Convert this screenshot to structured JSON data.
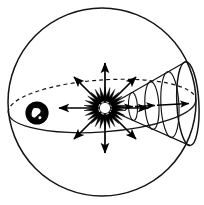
{
  "figure": {
    "title": "Solar radiation cone within celestial sphere",
    "type": "astronomy-schematic",
    "width": 204,
    "height": 205,
    "background_color": "#ffffff",
    "ink_color": "#000000"
  },
  "celestial_sphere": {
    "label": "celestial-sphere",
    "center_x": 102,
    "center_y": 102,
    "radius": 94,
    "stroke_width": 1.4,
    "fill": "#ffffff",
    "stroke": "#111111"
  },
  "orbit": {
    "label": "orbit-ellipse",
    "center_x": 102,
    "center_y": 106,
    "rx": 94,
    "ry": 26,
    "rotation_deg": -4,
    "near_half_style": "solid",
    "far_half_style": "dashed",
    "dash_pattern": "4 3",
    "stroke_width": 1.2,
    "stroke": "#111111"
  },
  "sun": {
    "label": "sun-star-burst",
    "center_x": 105,
    "center_y": 108,
    "inner_radius": 8,
    "outer_radius": 21,
    "spike_count": 26,
    "core_radius": 7,
    "fill": "#000000",
    "stroke": "#000000"
  },
  "earth": {
    "label": "earth-disc",
    "center_x": 37,
    "center_y": 113,
    "radius": 11.5,
    "ring_width": 4.5,
    "fill": "#000000",
    "landmass_fill": "#ffffff",
    "landmass_label": "continent-mark"
  },
  "radial_arrows": {
    "label": "solar-radiation-arrows",
    "origin_x": 105,
    "origin_y": 108,
    "count": 8,
    "stroke_width": 1.6,
    "stroke": "#000000",
    "rays": [
      {
        "name": "ray-north",
        "angle_deg": 270,
        "length": 45
      },
      {
        "name": "ray-northeast",
        "angle_deg": 315,
        "length": 44
      },
      {
        "name": "ray-east",
        "angle_deg": 0,
        "length": 40
      },
      {
        "name": "ray-southeast",
        "angle_deg": 45,
        "length": 44
      },
      {
        "name": "ray-south",
        "angle_deg": 90,
        "length": 45
      },
      {
        "name": "ray-southwest",
        "angle_deg": 135,
        "length": 44
      },
      {
        "name": "ray-west",
        "angle_deg": 180,
        "length": 46
      },
      {
        "name": "ray-northwest",
        "angle_deg": 225,
        "length": 44
      }
    ]
  },
  "cone": {
    "label": "radiation-cone",
    "apex_x": 105,
    "apex_y": 108,
    "base_x": 188,
    "base_ry": 42,
    "base_rx": 11,
    "axis_tilt_deg": -3,
    "stroke_width": 1.2,
    "stroke": "#111111",
    "cross_sections": [
      {
        "name": "cone-section-1",
        "x": 133,
        "rx": 4.5,
        "ry": 14
      },
      {
        "name": "cone-section-2",
        "x": 152,
        "rx": 7,
        "ry": 24
      },
      {
        "name": "cone-section-3",
        "x": 170,
        "rx": 9,
        "ry": 33
      },
      {
        "name": "cone-section-base",
        "x": 188,
        "rx": 11,
        "ry": 42
      }
    ],
    "axis_arrows": [
      {
        "name": "cone-axis-arrow-1",
        "x1": 112,
        "x2": 134
      },
      {
        "name": "cone-axis-arrow-2",
        "x1": 136,
        "x2": 156
      },
      {
        "name": "cone-axis-arrow-3",
        "x1": 158,
        "x2": 190
      }
    ]
  }
}
